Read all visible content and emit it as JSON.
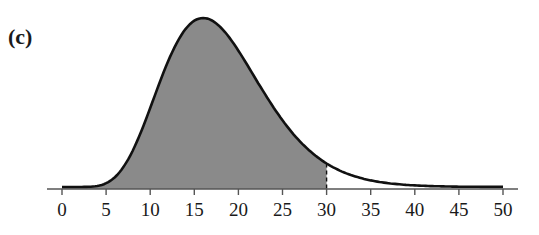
{
  "panel_label": "(c)",
  "colors": {
    "curve": "#111111",
    "shade": "#8a8a8a",
    "axis": "#555555",
    "text": "#1a1a1a"
  },
  "chart_data": {
    "type": "area",
    "title": "",
    "panel_label": "(c)",
    "xlabel": "",
    "ylabel": "",
    "xlim": [
      0,
      50
    ],
    "xticks": [
      0,
      5,
      10,
      15,
      20,
      25,
      30,
      35,
      40,
      45,
      50
    ],
    "grid": false,
    "legend": null,
    "distribution": {
      "family": "chi-square",
      "df": 18
    },
    "shaded_region": {
      "from": 0,
      "to": 30
    },
    "boundary_line": {
      "x": 30,
      "style": "dashed"
    },
    "peak": {
      "x": 16,
      "relative_height": 1.0
    },
    "x": [
      0,
      2,
      4,
      6,
      8,
      10,
      12,
      14,
      16,
      18,
      20,
      22,
      24,
      26,
      28,
      30,
      32,
      34,
      36,
      38,
      40,
      42,
      44,
      46,
      48,
      50
    ],
    "relative_density": [
      0.0,
      0.0,
      0.02,
      0.09,
      0.25,
      0.47,
      0.7,
      0.89,
      1.0,
      1.0,
      0.93,
      0.81,
      0.67,
      0.53,
      0.41,
      0.3,
      0.22,
      0.15,
      0.1,
      0.07,
      0.05,
      0.03,
      0.02,
      0.01,
      0.01,
      0.0
    ]
  }
}
